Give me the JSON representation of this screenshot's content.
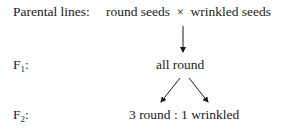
{
  "diagram": {
    "rows": [
      {
        "label": "Parental lines:",
        "content_left": "round seeds",
        "cross_symbol": "×",
        "content_right": "wrinkled seeds"
      },
      {
        "label_main": "F",
        "label_sub": "1",
        "label_suffix": ":",
        "content": "all round"
      },
      {
        "label_main": "F",
        "label_sub": "2",
        "label_suffix": ":",
        "content": "3 round : 1 wrinkled"
      }
    ],
    "arrows": [
      {
        "from": "parental",
        "to": "F1",
        "direction": "down"
      },
      {
        "from": "F1",
        "to": "F2",
        "direction": "down-left"
      },
      {
        "from": "F1",
        "to": "F2",
        "direction": "down-right"
      }
    ],
    "colors": {
      "text": "#1a1a1a",
      "background": "#ffffff"
    }
  }
}
